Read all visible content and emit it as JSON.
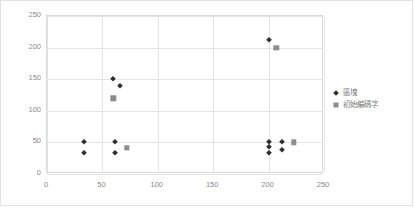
{
  "chart_data": {
    "type": "scatter",
    "title": "",
    "xlabel": "",
    "ylabel": "",
    "xlim": [
      0,
      250
    ],
    "ylim": [
      0,
      250
    ],
    "xticks": [
      0,
      50,
      100,
      150,
      200,
      250
    ],
    "yticks": [
      0,
      50,
      100,
      150,
      200,
      250
    ],
    "grid": true,
    "legend_position": "right",
    "series": [
      {
        "name": "區塊",
        "marker": "diamond",
        "color": "#2f2f2f",
        "points": [
          [
            33,
            50
          ],
          [
            33,
            33
          ],
          [
            60,
            150
          ],
          [
            66,
            140
          ],
          [
            61,
            50
          ],
          [
            61,
            33
          ],
          [
            200,
            212
          ],
          [
            200,
            50
          ],
          [
            200,
            42
          ],
          [
            200,
            33
          ],
          [
            212,
            50
          ],
          [
            212,
            38
          ]
        ]
      },
      {
        "name": "初始編碼字",
        "marker": "square",
        "color": "#8d8d8d",
        "points": [
          [
            60,
            120
          ],
          [
            72,
            41
          ],
          [
            207,
            200
          ],
          [
            223,
            50
          ]
        ]
      }
    ]
  },
  "axis": {
    "y_labels": [
      "250",
      "200",
      "150",
      "100",
      "50",
      "0"
    ],
    "x_labels": [
      "0",
      "50",
      "100",
      "150",
      "200",
      "250"
    ]
  },
  "legend": {
    "items": [
      {
        "label": "區塊",
        "marker": "diamond-marker-icon"
      },
      {
        "label": "初始編碼字",
        "marker": "square-marker-icon"
      }
    ]
  },
  "colors": {
    "series1": "#2f2f2f",
    "series2": "#8d8d8d",
    "gridline": "#e4e4e4",
    "axis_text": "#8a8a8a",
    "border": "#d9d9d9"
  }
}
